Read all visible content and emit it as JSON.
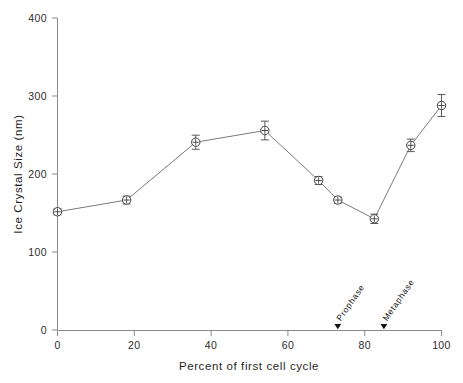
{
  "chart_data": {
    "type": "line",
    "title": "",
    "xlabel": "Percent of first cell cycle",
    "ylabel": "Ice Crystal Size (nm)",
    "xlim": [
      0,
      100
    ],
    "ylim": [
      0,
      400
    ],
    "xticks": [
      0,
      20,
      40,
      60,
      80,
      100
    ],
    "yticks": [
      0,
      100,
      200,
      300,
      400
    ],
    "xtick_labels": [
      "0",
      "20",
      "40",
      "60",
      "80",
      "100"
    ],
    "ytick_labels": [
      "0",
      "100",
      "200",
      "300",
      "400"
    ],
    "grid": false,
    "legend": "none",
    "series": [
      {
        "name": "Ice crystal size",
        "marker": "circle-with-cross",
        "x": [
          0,
          18,
          36,
          54,
          68,
          73,
          82.5,
          92,
          100
        ],
        "y": [
          152,
          167,
          241,
          256,
          192,
          167,
          143,
          237,
          288
        ],
        "yerr": [
          4,
          5,
          9,
          12,
          5,
          4,
          6,
          8,
          14
        ]
      }
    ],
    "annotations": [
      {
        "label": "Prophase",
        "x": 73,
        "y": 0,
        "marker": "down-triangle",
        "rotation": -55
      },
      {
        "label": "Metaphase",
        "x": 85,
        "y": 0,
        "marker": "down-triangle",
        "rotation": -55
      }
    ]
  },
  "axes": {
    "y_title": "Ice Crystal Size (nm)",
    "x_title": "Percent of first cell cycle",
    "y_labels": [
      "400",
      "300",
      "200",
      "100",
      "0"
    ],
    "x_labels": [
      "0",
      "20",
      "40",
      "60",
      "80",
      "100"
    ]
  },
  "annotations": {
    "prophase": "Prophase",
    "metaphase": "Metaphase"
  },
  "colors": {
    "background": "#ffffff",
    "axis": "#8a8a8a",
    "line": "#7b7b7b",
    "marker_stroke": "#3d3d3d",
    "text": "#1f1f1f"
  }
}
